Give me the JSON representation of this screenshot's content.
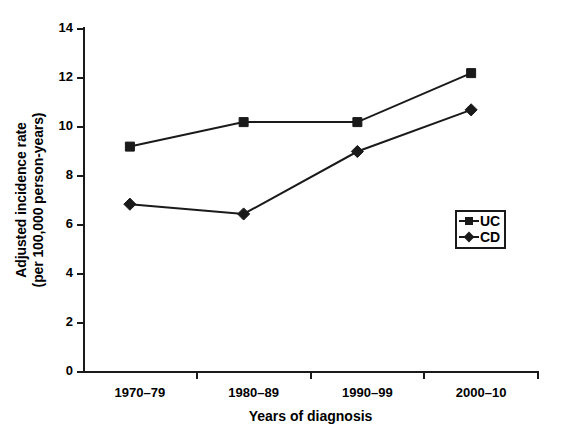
{
  "chart_data": {
    "type": "line",
    "title": "",
    "xlabel": "Years of diagnosis",
    "ylabel_line1": "Adjusted incidence rate",
    "ylabel_line2": "(per 100,000 person-years)",
    "categories": [
      "1970–79",
      "1980–89",
      "1990–99",
      "2000–10"
    ],
    "ylim": [
      0,
      14
    ],
    "yticks": [
      0,
      2,
      4,
      6,
      8,
      10,
      12,
      14
    ],
    "ytick_labels": [
      "0",
      "2",
      "4",
      "6",
      "8",
      "10",
      "12",
      "14"
    ],
    "grid": false,
    "legend_position": "center-right",
    "series": [
      {
        "name": "UC",
        "marker": "square",
        "color": "#1a1a1a",
        "values": [
          9.2,
          10.2,
          10.2,
          12.2
        ]
      },
      {
        "name": "CD",
        "marker": "diamond",
        "color": "#1a1a1a",
        "values": [
          6.85,
          6.45,
          9.0,
          10.7
        ]
      }
    ]
  },
  "legend": {
    "items": [
      {
        "label": "UC",
        "marker": "square"
      },
      {
        "label": "CD",
        "marker": "diamond"
      }
    ]
  }
}
